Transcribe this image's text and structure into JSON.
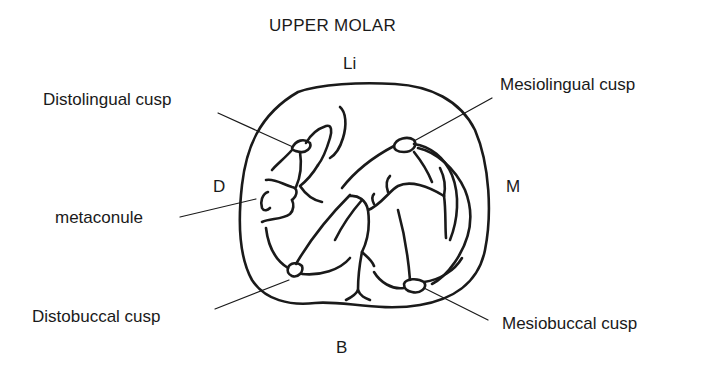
{
  "title": "UPPER MOLAR",
  "orientation": {
    "top": "Li",
    "bottom": "B",
    "left": "D",
    "right": "M"
  },
  "labels": [
    {
      "id": "distolingual",
      "text": "Distolingual cusp"
    },
    {
      "id": "metaconule",
      "text": "metaconule"
    },
    {
      "id": "distobuccal",
      "text": "Distobuccal cusp"
    },
    {
      "id": "mesiolingual",
      "text": "Mesiolingual cusp"
    },
    {
      "id": "mesiobuccal",
      "text": "Mesiobuccal cusp"
    }
  ],
  "colors": {
    "ink": "#1a1a1a",
    "background": "#ffffff"
  }
}
